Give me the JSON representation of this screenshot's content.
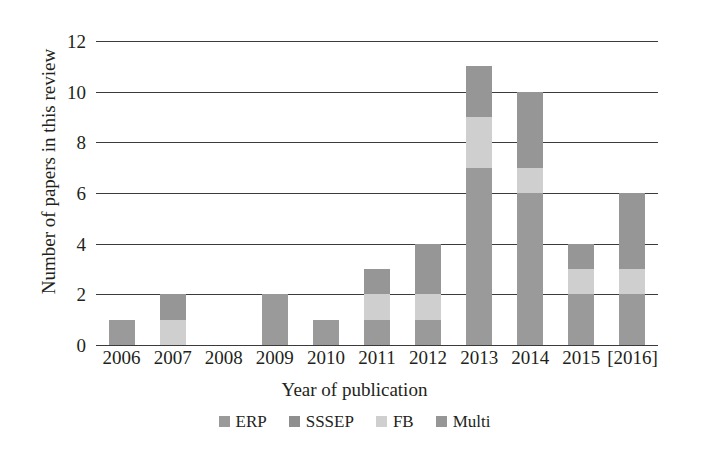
{
  "chart_data": {
    "type": "bar",
    "subtype": "stacked-bar",
    "title": "",
    "xlabel": "Year of publication",
    "ylabel": "Number of papers in this review",
    "categories": [
      "2006",
      "2007",
      "2008",
      "2009",
      "2010",
      "2011",
      "2012",
      "2013",
      "2014",
      "2015",
      "[2016]"
    ],
    "series": [
      {
        "name": "ERP",
        "color": "#9a9a9a",
        "values": [
          1,
          0,
          0,
          2,
          1,
          1,
          1,
          7,
          6,
          2,
          2
        ]
      },
      {
        "name": "SSSEP",
        "color": "#8f8f8f",
        "values": [
          0,
          0,
          0,
          0,
          0,
          0,
          0,
          0,
          0,
          0,
          0
        ]
      },
      {
        "name": "FB",
        "color": "#cfcfcf",
        "values": [
          0,
          1,
          0,
          0,
          0,
          1,
          1,
          2,
          1,
          1,
          1
        ]
      },
      {
        "name": "Multi",
        "color": "#969696",
        "values": [
          0,
          1,
          0,
          0,
          0,
          1,
          2,
          2,
          3,
          1,
          3
        ]
      }
    ],
    "totals": [
      1,
      2,
      0,
      2,
      1,
      3,
      4,
      11,
      10,
      4,
      6
    ],
    "ylim": [
      0,
      12
    ],
    "yticks": [
      0,
      2,
      4,
      6,
      8,
      10,
      12
    ],
    "ytick_labels": [
      "0",
      "2",
      "4",
      "6",
      "8",
      "10",
      "12"
    ],
    "grid": true,
    "grid_axis": "y",
    "legend_position": "bottom",
    "background": "#ffffff",
    "axis_color": "#3b3b3b",
    "text_color": "#231f20"
  },
  "legend": {
    "items": [
      {
        "label": "ERP",
        "color": "#9a9a9a"
      },
      {
        "label": "SSSEP",
        "color": "#8f8f8f"
      },
      {
        "label": "FB",
        "color": "#cfcfcf"
      },
      {
        "label": "Multi",
        "color": "#969696"
      }
    ]
  }
}
